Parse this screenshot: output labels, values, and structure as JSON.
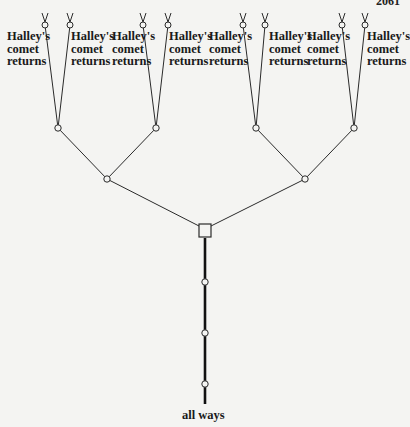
{
  "page_number": "2061",
  "leaf_labels": [
    {
      "line1": "Halley's",
      "line2": "comet",
      "line3": "returns"
    },
    {
      "line1": "Halley's",
      "line2": "comet",
      "line3": "returns"
    },
    {
      "line1": "Halley's",
      "line2": "comet",
      "line3": "returns"
    },
    {
      "line1": "Halley's",
      "line2": "comet",
      "line3": "returns"
    },
    {
      "line1": "Halley's",
      "line2": "comet",
      "line3": "returns"
    },
    {
      "line1": "Halley's",
      "line2": "comet",
      "line3": "returns"
    },
    {
      "line1": "Halley's",
      "line2": "comet",
      "line3": "returns"
    },
    {
      "line1": "Halley's",
      "line2": "comet",
      "line3": "returns"
    }
  ],
  "root_label": "all ways",
  "tree": {
    "root_node": "square",
    "trunk_nodes": 3,
    "branching_levels": 3,
    "leaf_count": 8
  }
}
